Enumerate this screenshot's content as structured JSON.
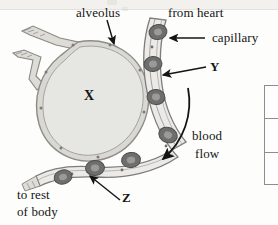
{
  "figure": {
    "type": "biology-diagram",
    "background_color": "#fdfdfc",
    "ink_color": "#141414"
  },
  "labels": {
    "alveolus": "alveolus",
    "from_heart": "from heart",
    "capillary": "capillary",
    "marker_y": "Y",
    "blood_flow_line1": "blood",
    "blood_flow_line2": "flow",
    "marker_x": "X",
    "marker_z": "Z",
    "to_rest_line1": "to rest",
    "to_rest_line2": "of body"
  },
  "structures": {
    "alveolus_fill": "#e6e6e3",
    "alveolus_wall": "#8d8c88",
    "capillary_fill": "#ebeae7",
    "capillary_wall": "#7e7d79",
    "red_blood_cell_ring": "#6e6e6c",
    "red_blood_cell_center": "#9a9a98",
    "bronchiole_fill": "#dedcd7"
  },
  "annotations": {
    "arrow_alveolus": "arrow pointing from alveolus label down to alveolus wall",
    "arrow_capillary": "arrow pointing left from capillary label to capillary wall",
    "arrow_y": "arrow pointing left from Y label to capillary wall layer",
    "arrow_z": "arrow pointing up-left from Z label to a red blood cell",
    "arrow_blood_flow": "curved arrow showing blood flow direction down and left"
  },
  "side_table": {
    "visible": "partially cropped table at right edge",
    "row_count": 3
  }
}
